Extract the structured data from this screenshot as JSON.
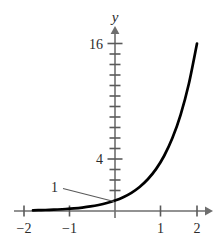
{
  "figure": {
    "background_color": "#ffffff",
    "curve_color": "#000000",
    "axis_color": "#6e6e6e",
    "text_color": "#2b2b2b"
  },
  "axes": {
    "y_axis_label": "y",
    "x_axis_label": "",
    "y_tick_labels": [
      "16",
      "4"
    ],
    "x_tick_labels": [
      "−2",
      "−1",
      "1",
      "2"
    ]
  },
  "annotations": [
    {
      "text": "1",
      "target": "y-intercept"
    }
  ],
  "chart_data": {
    "type": "line",
    "title": "",
    "subtitle": "",
    "xlabel": "",
    "ylabel": "y",
    "xlim": [
      -2.2,
      2.3
    ],
    "ylim": [
      0,
      18
    ],
    "grid": false,
    "legend": false,
    "x_ticks": [
      -2,
      -1,
      1,
      2
    ],
    "x_tick_labels": [
      "−2",
      "−1",
      "1",
      "2"
    ],
    "y_ticks": [
      1,
      2,
      3,
      4,
      5,
      6,
      7,
      8,
      9,
      10,
      11,
      12,
      13,
      14,
      15,
      16
    ],
    "y_tick_labels_shown": {
      "4": "4",
      "16": "16"
    },
    "series": [
      {
        "name": "y = 4^x",
        "x": [
          -2,
          -1.8,
          -1.6,
          -1.4,
          -1.2,
          -1,
          -0.8,
          -0.6,
          -0.4,
          -0.2,
          0,
          0.2,
          0.4,
          0.6,
          0.8,
          1,
          1.2,
          1.4,
          1.6,
          1.8,
          2
        ],
        "y": [
          0.0625,
          0.0825,
          0.1088,
          0.1436,
          0.1895,
          0.25,
          0.3299,
          0.4353,
          0.5743,
          0.7579,
          1,
          1.3195,
          1.7411,
          2.2974,
          3.0314,
          4,
          5.278,
          6.9644,
          9.1896,
          12.1257,
          16
        ]
      }
    ],
    "annotated_points": [
      {
        "label": "1",
        "x": 0,
        "y": 1
      }
    ]
  }
}
